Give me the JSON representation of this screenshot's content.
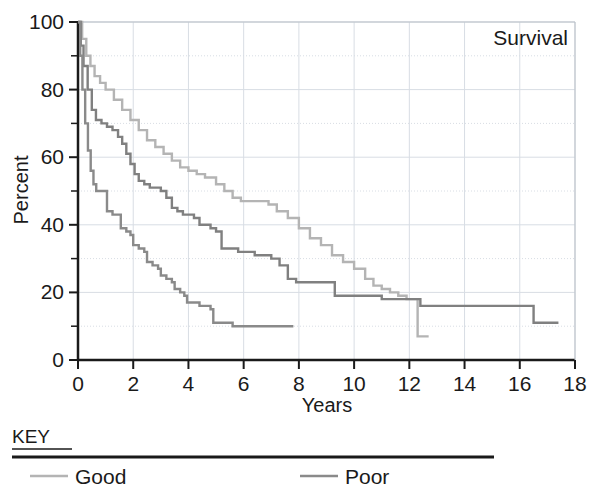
{
  "chart_data": {
    "type": "line",
    "title": "Survival",
    "xlabel": "Years",
    "ylabel": "Percent",
    "xlim": [
      0,
      18
    ],
    "ylim": [
      0,
      100
    ],
    "xticks": [
      0,
      2,
      4,
      6,
      8,
      10,
      12,
      14,
      16,
      18
    ],
    "xtick_labels": [
      "0",
      "2",
      "4",
      "6",
      "8",
      "10",
      "12",
      "14",
      "16",
      "18"
    ],
    "yticks": [
      0,
      20,
      40,
      60,
      80,
      100
    ],
    "ytick_labels": [
      "0",
      "20",
      "40",
      "60",
      "80",
      "100"
    ],
    "yminorticks": [
      10,
      30,
      50,
      70,
      90
    ],
    "grid": true,
    "grid_color": "#d8dde4",
    "legend_position": "below-plot",
    "step_style": "post",
    "series": [
      {
        "name": "Good",
        "color": "#b4b4b4",
        "points": [
          [
            0.0,
            100
          ],
          [
            0.15,
            95
          ],
          [
            0.3,
            90
          ],
          [
            0.45,
            87
          ],
          [
            0.6,
            84
          ],
          [
            0.8,
            82
          ],
          [
            1.0,
            80
          ],
          [
            1.3,
            77
          ],
          [
            1.6,
            74
          ],
          [
            1.9,
            71
          ],
          [
            2.2,
            68
          ],
          [
            2.5,
            65
          ],
          [
            2.8,
            63
          ],
          [
            3.1,
            61
          ],
          [
            3.4,
            59
          ],
          [
            3.7,
            57
          ],
          [
            4.0,
            56
          ],
          [
            4.3,
            55
          ],
          [
            4.6,
            54
          ],
          [
            5.0,
            52
          ],
          [
            5.3,
            50
          ],
          [
            5.6,
            48
          ],
          [
            5.9,
            47
          ],
          [
            6.2,
            47
          ],
          [
            6.6,
            47
          ],
          [
            6.9,
            46
          ],
          [
            7.2,
            44
          ],
          [
            7.6,
            42
          ],
          [
            8.0,
            39
          ],
          [
            8.4,
            36
          ],
          [
            8.8,
            34
          ],
          [
            9.2,
            31
          ],
          [
            9.6,
            29
          ],
          [
            10.0,
            27
          ],
          [
            10.4,
            24
          ],
          [
            10.7,
            22
          ],
          [
            11.0,
            21
          ],
          [
            11.3,
            20
          ],
          [
            11.6,
            19
          ],
          [
            11.9,
            18
          ],
          [
            12.2,
            18
          ],
          [
            12.3,
            18
          ],
          [
            12.3,
            7
          ],
          [
            12.7,
            7
          ]
        ]
      },
      {
        "name": "Poor",
        "color": "#808080",
        "points": [
          [
            0.0,
            100
          ],
          [
            0.1,
            93
          ],
          [
            0.2,
            87
          ],
          [
            0.35,
            80
          ],
          [
            0.5,
            74
          ],
          [
            0.65,
            71
          ],
          [
            0.85,
            70
          ],
          [
            1.05,
            69
          ],
          [
            1.25,
            68
          ],
          [
            1.45,
            66
          ],
          [
            1.6,
            64
          ],
          [
            1.75,
            61
          ],
          [
            1.9,
            58
          ],
          [
            2.05,
            55
          ],
          [
            2.2,
            53
          ],
          [
            2.4,
            52
          ],
          [
            2.6,
            51
          ],
          [
            2.8,
            51
          ],
          [
            3.0,
            50
          ],
          [
            3.2,
            48
          ],
          [
            3.4,
            45
          ],
          [
            3.6,
            44
          ],
          [
            3.8,
            43
          ],
          [
            4.0,
            43
          ],
          [
            4.2,
            42
          ],
          [
            4.4,
            40
          ],
          [
            4.6,
            40
          ],
          [
            4.8,
            39
          ],
          [
            5.0,
            38
          ],
          [
            5.1,
            38
          ],
          [
            5.2,
            33
          ],
          [
            5.5,
            33
          ],
          [
            5.8,
            32
          ],
          [
            6.1,
            32
          ],
          [
            6.4,
            31
          ],
          [
            6.7,
            31
          ],
          [
            7.0,
            30
          ],
          [
            7.3,
            28
          ],
          [
            7.6,
            24
          ],
          [
            7.9,
            23
          ],
          [
            8.2,
            23
          ],
          [
            8.6,
            23
          ],
          [
            9.0,
            23
          ],
          [
            9.2,
            23
          ],
          [
            9.3,
            19
          ],
          [
            9.8,
            19
          ],
          [
            10.4,
            19
          ],
          [
            11.0,
            18
          ],
          [
            11.6,
            18
          ],
          [
            12.2,
            18
          ],
          [
            12.3,
            18
          ],
          [
            12.4,
            16
          ],
          [
            13.0,
            16
          ],
          [
            13.6,
            16
          ],
          [
            14.2,
            16
          ],
          [
            14.8,
            16
          ],
          [
            15.4,
            16
          ],
          [
            16.0,
            16
          ],
          [
            16.4,
            16
          ],
          [
            16.5,
            11
          ],
          [
            17.0,
            11
          ],
          [
            17.4,
            11
          ]
        ]
      },
      {
        "name": "Third",
        "color": "#8a8a8a",
        "points": [
          [
            0.0,
            100
          ],
          [
            0.08,
            90
          ],
          [
            0.16,
            80
          ],
          [
            0.26,
            70
          ],
          [
            0.36,
            62
          ],
          [
            0.46,
            56
          ],
          [
            0.56,
            52
          ],
          [
            0.66,
            50
          ],
          [
            0.8,
            50
          ],
          [
            0.95,
            50
          ],
          [
            1.05,
            44
          ],
          [
            1.25,
            43
          ],
          [
            1.45,
            43
          ],
          [
            1.55,
            39
          ],
          [
            1.75,
            38
          ],
          [
            1.9,
            37
          ],
          [
            2.0,
            34
          ],
          [
            2.2,
            33
          ],
          [
            2.4,
            32
          ],
          [
            2.5,
            29
          ],
          [
            2.7,
            28
          ],
          [
            2.9,
            27
          ],
          [
            3.0,
            25
          ],
          [
            3.2,
            24
          ],
          [
            3.4,
            23
          ],
          [
            3.5,
            21
          ],
          [
            3.7,
            20
          ],
          [
            3.85,
            19
          ],
          [
            3.95,
            17
          ],
          [
            4.15,
            17
          ],
          [
            4.4,
            16
          ],
          [
            4.6,
            16
          ],
          [
            4.8,
            15
          ],
          [
            4.9,
            11
          ],
          [
            5.3,
            11
          ],
          [
            5.6,
            10
          ],
          [
            6.0,
            10
          ],
          [
            6.5,
            10
          ],
          [
            7.0,
            10
          ],
          [
            7.4,
            10
          ],
          [
            7.8,
            10
          ]
        ]
      }
    ]
  },
  "axes": {
    "corner_label": "Survival",
    "x_title": "Years",
    "y_title": "Percent"
  },
  "key": {
    "title": "KEY",
    "entries": [
      {
        "label": "Good",
        "color": "#b4b4b4"
      },
      {
        "label": "Poor",
        "color": "#8a8a8a"
      }
    ]
  }
}
